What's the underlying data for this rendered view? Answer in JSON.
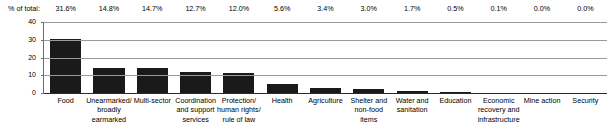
{
  "chart_data": {
    "type": "bar",
    "title": "",
    "xlabel": "",
    "ylabel": "",
    "ylim": [
      0,
      40
    ],
    "yticks": [
      0,
      10,
      20,
      30,
      40
    ],
    "grid": true,
    "legend": false,
    "pct_caption": "% of total:",
    "categories": [
      "Food",
      "Unearmarked/ broadly earmarked",
      "Multi-sector",
      "Coordination and support services",
      "Protection/ human rights/ rule of law",
      "Health",
      "Agriculture",
      "Shelter and non-food items",
      "Water and sanitation",
      "Education",
      "Economic recovery and infrastructure",
      "Mine action",
      "Security"
    ],
    "category_lines": [
      [
        "Food"
      ],
      [
        "Unearmarked/",
        "broadly",
        "earmarked"
      ],
      [
        "Multi-sector"
      ],
      [
        "Coordination",
        "and support",
        "services"
      ],
      [
        "Protection/",
        "human rights/",
        "rule of law"
      ],
      [
        "Health"
      ],
      [
        "Agriculture"
      ],
      [
        "Shelter and",
        "non-food",
        "items"
      ],
      [
        "Water and",
        "sanitation"
      ],
      [
        "Education"
      ],
      [
        "Economic",
        "recovery and",
        "infrastructure"
      ],
      [
        "Mine action"
      ],
      [
        "Security"
      ]
    ],
    "values": [
      30.6,
      14.0,
      14.0,
      12.0,
      11.3,
      5.0,
      2.9,
      2.4,
      1.2,
      0.35,
      0.1,
      0.0,
      0.0
    ],
    "pct_labels": [
      "31.6%",
      "14.8%",
      "14.7%",
      "12.7%",
      "12.0%",
      "5.6%",
      "3.4%",
      "3.0%",
      "1.7%",
      "0.5%",
      "0.1%",
      "0.0%",
      "0.0%"
    ],
    "ytick_labels": [
      "0",
      "10",
      "20",
      "30",
      "40"
    ],
    "colors": {
      "bar": "#1a1a1a",
      "grid": "#9a9a9a",
      "axis": "#2b2b2b",
      "text": "#000000",
      "background": "#ffffff"
    }
  }
}
